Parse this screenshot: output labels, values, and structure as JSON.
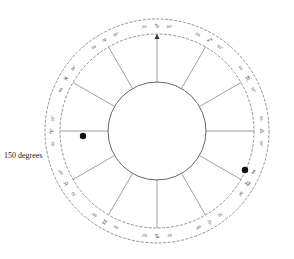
{
  "side_label": "150 degrees",
  "wheel": {
    "center": [
      157,
      131
    ],
    "outer_radius": 112,
    "band_inner_radius": 97,
    "hub_radius": 49,
    "line_color": "#777777",
    "dash_color": "#666666"
  },
  "cusps": [
    {
      "angle": 0,
      "deg1": "00°",
      "sign": "♎",
      "deg2": "00"
    },
    {
      "angle": 30,
      "deg1": "30°",
      "sign": "♏",
      "deg2": "00"
    },
    {
      "angle": 60,
      "deg1": "00°",
      "sign": "♐",
      "deg2": "00"
    },
    {
      "angle": 90,
      "deg1": "00°",
      "sign": "♑",
      "deg2": "00"
    },
    {
      "angle": 120,
      "deg1": "30°",
      "sign": "♒",
      "deg2": "00"
    },
    {
      "angle": 150,
      "deg1": "30°",
      "sign": "♓",
      "deg2": "00"
    },
    {
      "angle": 180,
      "deg1": "30°",
      "sign": "♈",
      "deg2": "00"
    },
    {
      "angle": 210,
      "deg1": "00°",
      "sign": "♉",
      "deg2": "30"
    },
    {
      "angle": 240,
      "deg1": "00°",
      "sign": "♊",
      "deg2": "00"
    },
    {
      "angle": 270,
      "deg1": "30°",
      "sign": "♋",
      "deg2": "00"
    },
    {
      "angle": 300,
      "deg1": "00°",
      "sign": "♌",
      "deg2": "30"
    },
    {
      "angle": 330,
      "deg1": "30°",
      "sign": "♍",
      "deg2": "00"
    }
  ],
  "planets": [
    {
      "name": "planet-left",
      "x": 83,
      "y": 136,
      "r": 3.2
    },
    {
      "name": "planet-right",
      "x": 245,
      "y": 170,
      "r": 3.2
    }
  ],
  "mc_arrow": {
    "angle": 90
  }
}
